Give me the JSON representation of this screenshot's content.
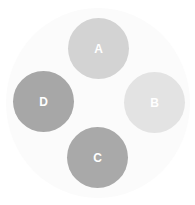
{
  "buttons": [
    {
      "label": "A",
      "color": "#d3d3d3",
      "cx": 98,
      "cy": 48
    },
    {
      "label": "B",
      "color": "#e3e3e3",
      "cx": 154,
      "cy": 102
    },
    {
      "label": "C",
      "color": "#a9a9a9",
      "cx": 97,
      "cy": 157
    },
    {
      "label": "D",
      "color": "#a7a7a7",
      "cx": 43,
      "cy": 101
    }
  ]
}
